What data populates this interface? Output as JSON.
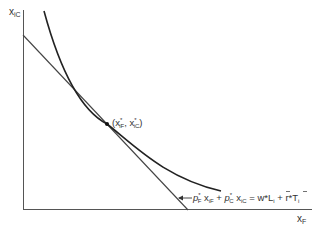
{
  "diagram": {
    "type": "indifference-curve-budget-line",
    "y_axis_label": "x",
    "y_axis_sub": "iC",
    "x_axis_label": "x",
    "x_axis_sub": "F",
    "tangency_point_label": {
      "open": "(x",
      "sub1": "iF",
      "sup1": "*",
      "sep": ", x",
      "sub2": "iC",
      "sup2": "*",
      "close": ")"
    },
    "budget_equation": {
      "p1": "p",
      "p1_sub": "F",
      "p1_sup": "*",
      "x1": " x",
      "x1_sub": "iF",
      "plus1": " + ",
      "p2": "p",
      "p2_sub": "C",
      "p2_sup": "*",
      "x2": " x",
      "x2_sub": "iC",
      "eq": " = w*",
      "L": "L",
      "L_sub": "i",
      "plus2": " + r*",
      "T": "T",
      "T_sub": "i"
    },
    "colors": {
      "axis": "#555555",
      "curve": "#222222",
      "budget_line": "#444444",
      "text": "#333333"
    }
  }
}
